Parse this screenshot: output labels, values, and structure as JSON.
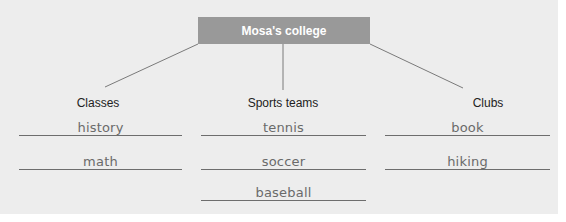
{
  "diagram": {
    "title": "Mosa's college",
    "colors": {
      "title_box": "#999999",
      "title_text": "#ffffff",
      "background": "#ededed",
      "lines": "#6d6d6d",
      "answer_text": "#6a6a6a"
    },
    "categories": [
      {
        "heading": "Classes",
        "answers": [
          "history",
          "math"
        ]
      },
      {
        "heading": "Sports teams",
        "answers": [
          "tennis",
          "soccer",
          "baseball"
        ]
      },
      {
        "heading": "Clubs",
        "answers": [
          "book",
          "hiking"
        ]
      }
    ]
  }
}
